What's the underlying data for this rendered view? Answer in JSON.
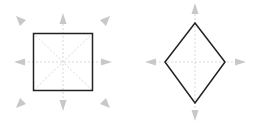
{
  "diagram": {
    "colors": {
      "shape_stroke": "#222222",
      "guide": "#d6d6d6",
      "arrow": "#c4c4c4",
      "background": "#ffffff"
    },
    "shapes": [
      {
        "type": "square",
        "center": [
          63,
          62
        ],
        "bounds": {
          "x": 33,
          "y": 33,
          "width": 60,
          "height": 58
        },
        "arrow_directions": [
          "n",
          "ne",
          "e",
          "se",
          "s",
          "sw",
          "w",
          "nw"
        ]
      },
      {
        "type": "diamond",
        "center": [
          195,
          62
        ],
        "vertices": {
          "top": [
            195,
            23
          ],
          "right": [
            225,
            62
          ],
          "bottom": [
            195,
            103
          ],
          "left": [
            165,
            62
          ]
        },
        "arrow_directions": [
          "n",
          "e",
          "s",
          "w"
        ]
      }
    ]
  }
}
